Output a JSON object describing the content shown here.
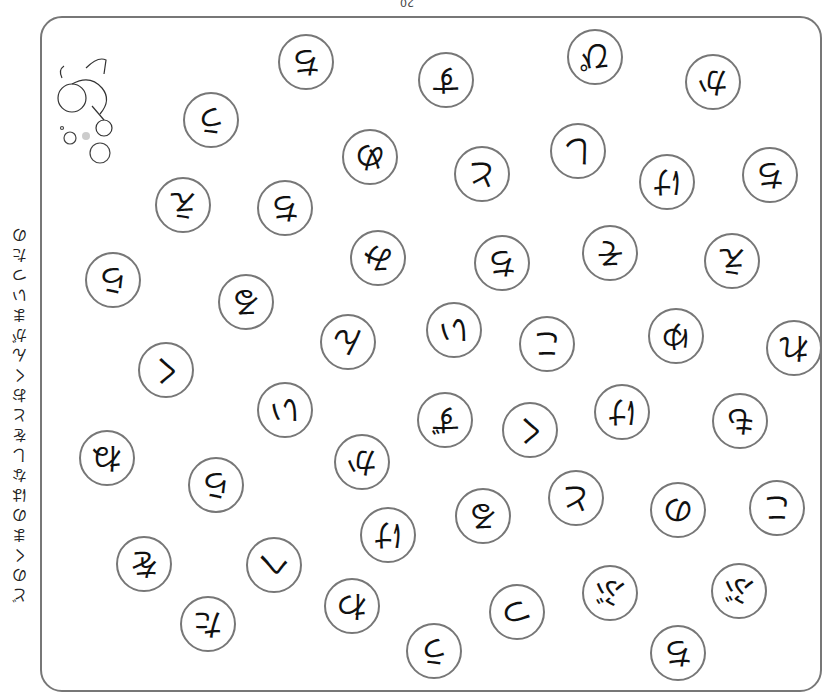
{
  "page": {
    "number": "20"
  },
  "side_text": [
    "ど",
    "の",
    "く",
    "ま",
    "の",
    "は",
    "な",
    "し",
    "を",
    "と",
    "お",
    "く",
    "ん",
    "が",
    "ま",
    "い",
    "つ",
    "た",
    "の"
  ],
  "bubbles": [
    {
      "kana": "ち",
      "x": 306,
      "y": 62
    },
    {
      "kana": "う",
      "x": 211,
      "y": 120
    },
    {
      "kana": "す",
      "x": 446,
      "y": 80
    },
    {
      "kana": "ぴ",
      "x": 595,
      "y": 57
    },
    {
      "kana": "か",
      "x": 713,
      "y": 82
    },
    {
      "kana": "め",
      "x": 370,
      "y": 157
    },
    {
      "kana": "と",
      "x": 482,
      "y": 174
    },
    {
      "kana": "し",
      "x": 578,
      "y": 151
    },
    {
      "kana": "け",
      "x": 667,
      "y": 182
    },
    {
      "kana": "ち",
      "x": 770,
      "y": 175
    },
    {
      "kana": "え",
      "x": 183,
      "y": 205
    },
    {
      "kana": "ち",
      "x": 285,
      "y": 208
    },
    {
      "kana": "み",
      "x": 378,
      "y": 258
    },
    {
      "kana": "ち",
      "x": 502,
      "y": 263
    },
    {
      "kana": "そ",
      "x": 610,
      "y": 253
    },
    {
      "kana": "え",
      "x": 732,
      "y": 261
    },
    {
      "kana": "ら",
      "x": 113,
      "y": 280
    },
    {
      "kana": "る",
      "x": 246,
      "y": 302
    },
    {
      "kana": "ん",
      "x": 348,
      "y": 342
    },
    {
      "kana": "い",
      "x": 454,
      "y": 330
    },
    {
      "kana": "こ",
      "x": 547,
      "y": 344
    },
    {
      "kana": "ゆ",
      "x": 676,
      "y": 336
    },
    {
      "kana": "れ",
      "x": 794,
      "y": 348
    },
    {
      "kana": "く",
      "x": 166,
      "y": 370
    },
    {
      "kana": "い",
      "x": 285,
      "y": 410
    },
    {
      "kana": "ず",
      "x": 445,
      "y": 420
    },
    {
      "kana": "く",
      "x": 530,
      "y": 430
    },
    {
      "kana": "け",
      "x": 622,
      "y": 412
    },
    {
      "kana": "も",
      "x": 740,
      "y": 421
    },
    {
      "kana": "ね",
      "x": 107,
      "y": 458
    },
    {
      "kana": "ら",
      "x": 216,
      "y": 485
    },
    {
      "kana": "か",
      "x": 362,
      "y": 462
    },
    {
      "kana": "る",
      "x": 483,
      "y": 516
    },
    {
      "kana": "と",
      "x": 576,
      "y": 498
    },
    {
      "kana": "の",
      "x": 678,
      "y": 510
    },
    {
      "kana": "こ",
      "x": 777,
      "y": 508
    },
    {
      "kana": "け",
      "x": 388,
      "y": 535
    },
    {
      "kana": "を",
      "x": 144,
      "y": 564
    },
    {
      "kana": "へ",
      "x": 274,
      "y": 565
    },
    {
      "kana": "わ",
      "x": 352,
      "y": 606
    },
    {
      "kana": "つ",
      "x": 517,
      "y": 612
    },
    {
      "kana": "ぶ",
      "x": 610,
      "y": 593
    },
    {
      "kana": "ぶ",
      "x": 739,
      "y": 591
    },
    {
      "kana": "た",
      "x": 208,
      "y": 624
    },
    {
      "kana": "う",
      "x": 434,
      "y": 651
    },
    {
      "kana": "ち",
      "x": 678,
      "y": 653
    }
  ]
}
